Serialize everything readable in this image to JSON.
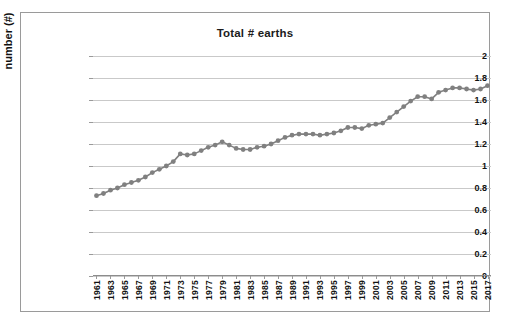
{
  "chart_data": {
    "type": "line",
    "title": "Total # earths",
    "xlabel": "",
    "ylabel": "number (#)",
    "ylim": [
      0,
      2
    ],
    "ytick_step": 0.2,
    "ytick_labels": [
      "2",
      "1.8",
      "1.6",
      "1.4",
      "1.2",
      "1",
      "0.8",
      "0.6",
      "0.4",
      "0.2",
      "0"
    ],
    "ytick_values": [
      2,
      1.8,
      1.6,
      1.4,
      1.2,
      1,
      0.8,
      0.6,
      0.4,
      0.2,
      0
    ],
    "grid": true,
    "legend": "none",
    "marker": "circle",
    "line_color": "#808080",
    "marker_color": "#808080",
    "gridline_color": "#c9c9c9",
    "x": [
      1961,
      1962,
      1963,
      1964,
      1965,
      1966,
      1967,
      1968,
      1969,
      1970,
      1971,
      1972,
      1973,
      1974,
      1975,
      1976,
      1977,
      1978,
      1979,
      1980,
      1981,
      1982,
      1983,
      1984,
      1985,
      1986,
      1987,
      1988,
      1989,
      1990,
      1991,
      1992,
      1993,
      1994,
      1995,
      1996,
      1997,
      1998,
      1999,
      2000,
      2001,
      2002,
      2003,
      2004,
      2005,
      2006,
      2007,
      2008,
      2009,
      2010,
      2011,
      2012,
      2013,
      2014,
      2015,
      2016,
      2017
    ],
    "xtick_labels": [
      "1961",
      "1963",
      "1965",
      "1967",
      "1969",
      "1971",
      "1973",
      "1975",
      "1977",
      "1979",
      "1981",
      "1983",
      "1985",
      "1987",
      "1989",
      "1991",
      "1993",
      "1995",
      "1997",
      "1999",
      "2001",
      "2003",
      "2005",
      "2007",
      "2009",
      "2011",
      "2013",
      "2015",
      "2017"
    ],
    "values": [
      0.73,
      0.75,
      0.78,
      0.8,
      0.83,
      0.85,
      0.87,
      0.9,
      0.94,
      0.97,
      1.0,
      1.04,
      1.11,
      1.1,
      1.11,
      1.14,
      1.17,
      1.19,
      1.22,
      1.19,
      1.16,
      1.15,
      1.15,
      1.17,
      1.18,
      1.2,
      1.23,
      1.26,
      1.28,
      1.29,
      1.29,
      1.29,
      1.28,
      1.29,
      1.3,
      1.32,
      1.35,
      1.35,
      1.34,
      1.37,
      1.38,
      1.39,
      1.44,
      1.49,
      1.54,
      1.59,
      1.63,
      1.63,
      1.61,
      1.67,
      1.69,
      1.71,
      1.71,
      1.7,
      1.69,
      1.7,
      1.73
    ]
  }
}
